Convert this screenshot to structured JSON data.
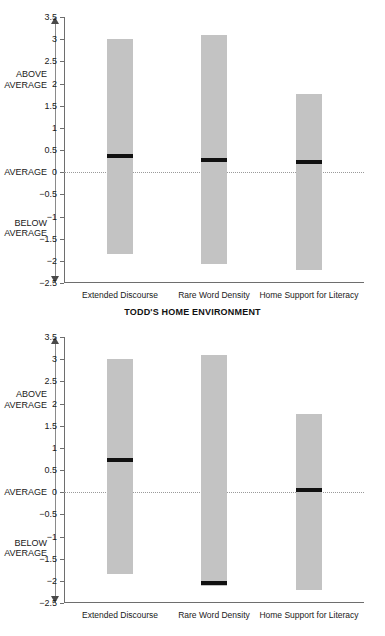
{
  "chart_data": [
    {
      "id": "todds-home-environment",
      "type": "bar",
      "title": "TODD'S HOME ENVIRONMENT",
      "xlabel": "",
      "ylabel": "",
      "ylim": [
        -2.5,
        3.5
      ],
      "ytick_step": 0.5,
      "yticks": [
        "3.5",
        "3",
        "2.5",
        "2",
        "1.5",
        "1",
        "0.5",
        "0",
        "−0.5",
        "−1",
        "−1.5",
        "−2",
        "−2.5"
      ],
      "ytick_values": [
        3.5,
        3,
        2.5,
        2,
        1.5,
        1,
        0.5,
        0,
        -0.5,
        -1,
        -1.5,
        -2,
        -2.5
      ],
      "grid": false,
      "zero_reference_line": true,
      "zero_reference_label": "AVERAGE",
      "categories": [
        "Extended Discourse",
        "Rare Word Density",
        "Home Support for Literacy"
      ],
      "range_bars": [
        {
          "category": "Extended Discourse",
          "low": -1.85,
          "high": 3.0,
          "marker": 0.37
        },
        {
          "category": "Rare Word Density",
          "low": -2.07,
          "high": 3.1,
          "marker": 0.27
        },
        {
          "category": "Home Support for Literacy",
          "low": -2.2,
          "high": 1.77,
          "marker": 0.22
        }
      ],
      "annotations": [
        {
          "text": "ABOVE AVERAGE",
          "at": 2.1
        },
        {
          "text": "AVERAGE",
          "at": 0
        },
        {
          "text": "BELOW AVERAGE",
          "at": -1.25
        }
      ],
      "colors": {
        "bar_fill": "#c3c3c3",
        "marker": "#111111",
        "axis": "#6e6e6e",
        "zero_line": "#9a9a9a"
      }
    },
    {
      "id": "second-panel",
      "type": "bar",
      "title": "",
      "xlabel": "",
      "ylabel": "",
      "ylim": [
        -2.5,
        3.5
      ],
      "ytick_step": 0.5,
      "yticks": [
        "3.5",
        "3",
        "2.5",
        "2",
        "1.5",
        "1",
        "0.5",
        "0",
        "−0.5",
        "−1",
        "−1.5",
        "−2",
        "−2.5"
      ],
      "ytick_values": [
        3.5,
        3,
        2.5,
        2,
        1.5,
        1,
        0.5,
        0,
        -0.5,
        -1,
        -1.5,
        -2,
        -2.5
      ],
      "grid": false,
      "zero_reference_line": true,
      "zero_reference_label": "AVERAGE",
      "categories": [
        "Extended Discourse",
        "Rare Word Density",
        "Home Support for Literacy"
      ],
      "range_bars": [
        {
          "category": "Extended Discourse",
          "low": -1.85,
          "high": 3.0,
          "marker": 0.72
        },
        {
          "category": "Rare Word Density",
          "low": -2.12,
          "high": 3.1,
          "marker": -2.05
        },
        {
          "category": "Home Support for Literacy",
          "low": -2.2,
          "high": 1.77,
          "marker": 0.05
        }
      ],
      "annotations": [
        {
          "text": "ABOVE AVERAGE",
          "at": 2.1
        },
        {
          "text": "AVERAGE",
          "at": 0
        },
        {
          "text": "BELOW AVERAGE",
          "at": -1.25
        }
      ],
      "colors": {
        "bar_fill": "#c3c3c3",
        "marker": "#111111",
        "axis": "#6e6e6e",
        "zero_line": "#9a9a9a"
      }
    }
  ],
  "labels": {
    "above_average_line1": "ABOVE",
    "above_average_line2": "AVERAGE",
    "average": "AVERAGE",
    "below_average_line1": "BELOW",
    "below_average_line2": "AVERAGE"
  }
}
